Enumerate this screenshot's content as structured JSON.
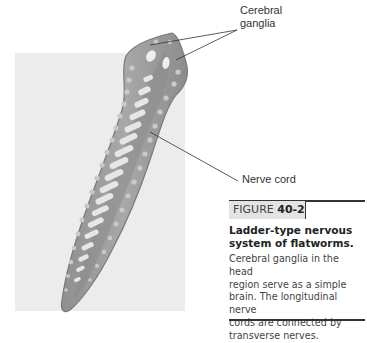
{
  "figure": {
    "labels": {
      "cerebral_ganglia": [
        "Cerebral",
        "ganglia"
      ],
      "nerve_cord": "Nerve cord"
    },
    "caption": {
      "tab_prefix": "FIGURE ",
      "tab_number": "40-2",
      "title_lines": [
        "Ladder-type nervous",
        "system of flatworms."
      ],
      "body_lines": [
        "Cerebral ganglia in the head",
        "region serve as a simple",
        "brain. The longitudinal nerve",
        "cords are connected by",
        "transverse nerves."
      ]
    },
    "colors": {
      "background_box": "#ececec",
      "worm_body": "#9e9e9e",
      "worm_outline": "#7a7a7a",
      "nerve_rungs": "#e6e6e6",
      "rule": "#333333"
    }
  }
}
